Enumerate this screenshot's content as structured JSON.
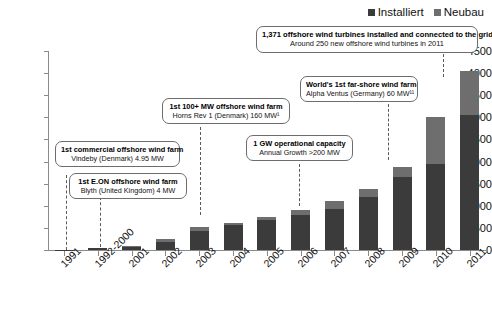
{
  "legend": {
    "position": "top-right",
    "entries": [
      {
        "label": "Installiert",
        "color": "#3b3b3b"
      },
      {
        "label": "Neubau",
        "color": "#6e6e6e"
      }
    ]
  },
  "axes": {
    "y_ticks": [
      "4500",
      "4000",
      "3500",
      "3000",
      "2500",
      "2000",
      "1500",
      "1000",
      "500",
      "0"
    ],
    "x_ticks": [
      "1991",
      "1992-2000",
      "2001",
      "2002",
      "2003",
      "2004",
      "2005",
      "2006",
      "2007",
      "2008",
      "2009",
      "2010",
      "2011"
    ]
  },
  "callouts": [
    {
      "name": "callout-vindeby",
      "line1": "1st commercial offshore wind farm",
      "line2": "Vindeby (Denmark) 4.95 MW"
    },
    {
      "name": "callout-blyth",
      "line1": "1st E.ON offshore wind farm",
      "line2": "Blyth (United Kingdom) 4 MW"
    },
    {
      "name": "callout-horns-rev",
      "line1": "1st 100+ MW offshore wind farm",
      "line2": "Horns Rev 1 (Denmark) 160 MW¹"
    },
    {
      "name": "callout-one-gw",
      "line1": "1 GW operational capacity",
      "line2": "Annual Growth >200 MW"
    },
    {
      "name": "callout-alpha-ventus",
      "line1": "World's 1st far-shore wind farm",
      "line2": "Alpha Ventus (Germany) 60 MW¹¹"
    },
    {
      "name": "callout-turbine-total",
      "line1": "1,371 offshore wind turbines installed and connected to the grid",
      "line2": "Around 250 new offshore wind turbines in 2011"
    }
  ],
  "chart_data": {
    "type": "bar",
    "title": "",
    "subtitle": "",
    "xlabel": "",
    "ylabel": "",
    "ylim": [
      0,
      4500
    ],
    "ytick_step": 500,
    "grid": false,
    "stacked": true,
    "legend_position": "top-right",
    "categories": [
      "1991",
      "1992-2000",
      "2001",
      "2002",
      "2003",
      "2004",
      "2005",
      "2006",
      "2007",
      "2008",
      "2009",
      "2010",
      "2011"
    ],
    "series": [
      {
        "name": "Installiert",
        "color": "#3b3b3b",
        "values": [
          5,
          35,
          75,
          185,
          440,
          570,
          680,
          790,
          930,
          1200,
          1650,
          1950,
          3050
        ]
      },
      {
        "name": "Neubau",
        "color": "#6e6e6e",
        "values": [
          0,
          15,
          10,
          65,
          90,
          40,
          60,
          110,
          180,
          170,
          230,
          1050,
          1000
        ]
      }
    ],
    "totals": [
      5,
      50,
      85,
      250,
      530,
      610,
      740,
      900,
      1110,
      1370,
      1880,
      3000,
      4050
    ],
    "units": "MW"
  }
}
